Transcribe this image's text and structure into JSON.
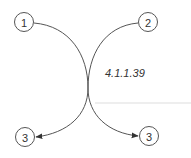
{
  "diagram": {
    "enzyme_label": "4.1.1.39",
    "nodes": [
      {
        "id": "n1",
        "label": "1",
        "cx": 24,
        "cy": 22
      },
      {
        "id": "n2",
        "label": "2",
        "cx": 148,
        "cy": 22
      },
      {
        "id": "n3a",
        "label": "3",
        "cx": 25,
        "cy": 137
      },
      {
        "id": "n3b",
        "label": "3",
        "cx": 149,
        "cy": 136
      }
    ],
    "edges": [
      {
        "from": "1",
        "to": "3 (right)"
      },
      {
        "from": "2",
        "to": "3 (left)"
      }
    ],
    "colors": {
      "stroke": "#555555",
      "text": "#333333",
      "rule": "#dddddd"
    }
  }
}
